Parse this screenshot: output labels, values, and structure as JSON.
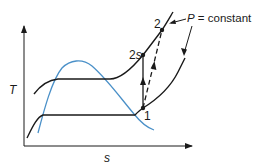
{
  "diagram": {
    "type": "T-s diagram (compressor process)",
    "axes": {
      "y_label": "T",
      "x_label": "s"
    },
    "points": [
      {
        "id": "1",
        "label": "1"
      },
      {
        "id": "2s",
        "label_main": "2",
        "label_sub": "s"
      },
      {
        "id": "2",
        "label": "2"
      }
    ],
    "annotation": {
      "var": "P",
      "rest": " = constant"
    },
    "colors": {
      "curve": "#1a1a1a",
      "saturation_dome": "#4a90c8",
      "background": "#ffffff"
    },
    "processes": [
      {
        "from": "1",
        "to": "2s",
        "style": "solid",
        "name": "isentropic compression"
      },
      {
        "from": "1",
        "to": "2",
        "style": "dashed",
        "name": "actual compression"
      }
    ]
  }
}
